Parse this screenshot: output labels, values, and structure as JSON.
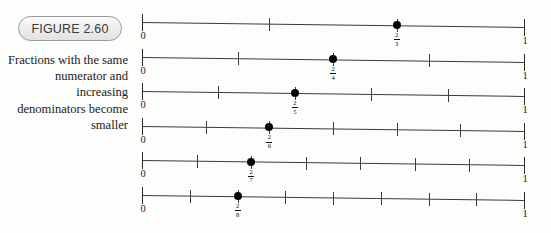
{
  "figure": {
    "badge_label": "FIGURE 2.60",
    "caption": "Fractions with the same numerator and increasing denominators become smaller"
  },
  "axis_labels": {
    "start": "0",
    "end": "1"
  },
  "chart_data": {
    "type": "numberline",
    "title": "FIGURE 2.60",
    "description": "Fractions with the same numerator and increasing denominators become smaller",
    "xlim": [
      0,
      1
    ],
    "grid": false,
    "legend": null,
    "lines": [
      {
        "denominator": 3,
        "interior_ticks": 2,
        "tick_values": [
          0.3333,
          0.6667
        ],
        "marked_point": {
          "numerator": 2,
          "denominator": 3,
          "value": 0.6667,
          "label": "2/3"
        }
      },
      {
        "denominator": 4,
        "interior_ticks": 3,
        "tick_values": [
          0.25,
          0.5,
          0.75
        ],
        "marked_point": {
          "numerator": 2,
          "denominator": 4,
          "value": 0.5,
          "label": "2/4"
        }
      },
      {
        "denominator": 5,
        "interior_ticks": 4,
        "tick_values": [
          0.2,
          0.4,
          0.6,
          0.8
        ],
        "marked_point": {
          "numerator": 2,
          "denominator": 5,
          "value": 0.4,
          "label": "2/5"
        }
      },
      {
        "denominator": 6,
        "interior_ticks": 5,
        "tick_values": [
          0.1667,
          0.3333,
          0.5,
          0.6667,
          0.8333
        ],
        "marked_point": {
          "numerator": 2,
          "denominator": 6,
          "value": 0.3333,
          "label": "2/6"
        }
      },
      {
        "denominator": 7,
        "interior_ticks": 6,
        "tick_values": [
          0.1429,
          0.2857,
          0.4286,
          0.5714,
          0.7143,
          0.8571
        ],
        "marked_point": {
          "numerator": 2,
          "denominator": 7,
          "value": 0.2857,
          "label": "2/7"
        }
      },
      {
        "denominator": 8,
        "interior_ticks": 7,
        "tick_values": [
          0.125,
          0.25,
          0.375,
          0.5,
          0.625,
          0.75,
          0.875
        ],
        "marked_point": {
          "numerator": 2,
          "denominator": 8,
          "value": 0.25,
          "label": "2/8"
        }
      }
    ]
  }
}
